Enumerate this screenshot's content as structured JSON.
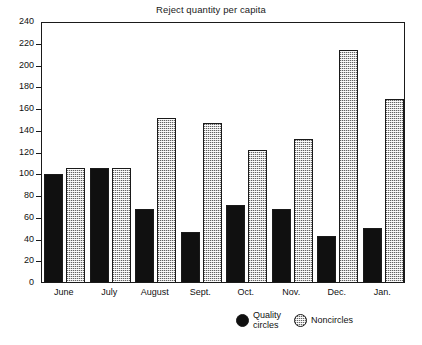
{
  "chart_data": {
    "type": "bar",
    "title": "Reject quantity per capita",
    "xlabel": "",
    "ylabel": "",
    "ylim": [
      0,
      240
    ],
    "ytick_step": 20,
    "yticks": [
      0,
      20,
      40,
      60,
      80,
      100,
      120,
      140,
      160,
      180,
      200,
      220,
      240
    ],
    "grid": false,
    "legend_position": "bottom-right",
    "categories": [
      "June",
      "July",
      "August",
      "Sept.",
      "Oct.",
      "Nov.",
      "Dec.",
      "Jan."
    ],
    "series": [
      {
        "name": "Quality\ncircles",
        "legend_label": "Quality\ncircles",
        "fill": "solid-black",
        "color": "#101010",
        "values": [
          100,
          106,
          68,
          47,
          72,
          68,
          43,
          51
        ]
      },
      {
        "name": "Noncircles",
        "legend_label": "Noncircles",
        "fill": "dotted-gray",
        "color": "#d2d2d2",
        "values": [
          106,
          106,
          152,
          147,
          122,
          132,
          214,
          169
        ]
      }
    ]
  },
  "colors": {
    "axis": "#1a1a1a",
    "background": "#ffffff",
    "quality_circles": "#101010",
    "noncircles": "#d2d2d2"
  }
}
